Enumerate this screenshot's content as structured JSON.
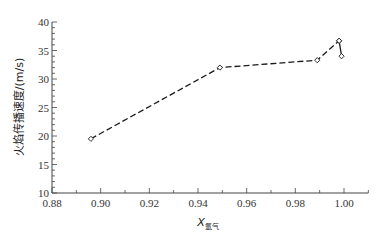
{
  "chart_data": {
    "type": "line",
    "title": "",
    "xlabel": "X氩气",
    "xlabel_main": "X",
    "xlabel_sub": "氩气",
    "ylabel": "火焰传播速度/(m/s)",
    "xlim": [
      0.88,
      1.01
    ],
    "ylim": [
      10,
      40
    ],
    "x_ticks": [
      "0.88",
      "0.90",
      "0.92",
      "0.94",
      "0.96",
      "0.98",
      "1.00"
    ],
    "y_ticks": [
      "10",
      "15",
      "20",
      "25",
      "30",
      "35",
      "40"
    ],
    "grid": false,
    "legend": null,
    "series": [
      {
        "name": "flame speed",
        "line_style": "dashed",
        "marker": "open-diamond",
        "x": [
          0.896,
          0.949,
          0.989,
          0.998
        ],
        "y": [
          19.5,
          32.0,
          33.3,
          36.7
        ]
      },
      {
        "name": "flame speed (endpoint)",
        "line_style": "solid",
        "marker": "open-diamond",
        "x": [
          0.998,
          0.999
        ],
        "y": [
          36.7,
          34.0
        ]
      }
    ]
  },
  "colors": {
    "line": "#1a1a1a",
    "axis": "#444444"
  }
}
